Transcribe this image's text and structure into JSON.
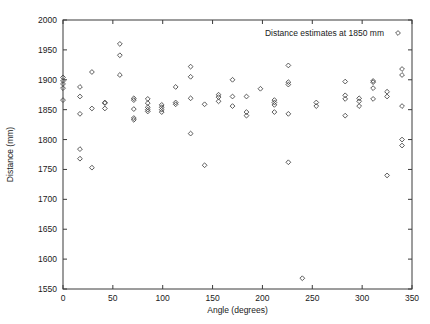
{
  "figure": {
    "background": "#ffffff",
    "frame_color": "#3a3a3a",
    "marker_color": "#4a4a4a",
    "marker_shape": "diamond"
  },
  "chart_data": {
    "type": "scatter",
    "title": "",
    "xlabel": "Angle (degrees)",
    "ylabel": "Distance (mm)",
    "xlim": [
      0,
      350
    ],
    "ylim": [
      1550,
      2000
    ],
    "xticks": [
      0,
      50,
      100,
      150,
      200,
      250,
      300,
      350
    ],
    "yticks": [
      1550,
      1600,
      1650,
      1700,
      1750,
      1800,
      1850,
      1900,
      1950,
      2000
    ],
    "grid": false,
    "legend": {
      "position": "top-right",
      "entries": [
        {
          "label": "Distance estimates at 1850 mm",
          "marker": "diamond"
        }
      ]
    },
    "series": [
      {
        "name": "Distance estimates at 1850 mm",
        "points": [
          [
            0,
            1904
          ],
          [
            0,
            1898
          ],
          [
            0,
            1893
          ],
          [
            0,
            1886
          ],
          [
            0,
            1866
          ],
          [
            17,
            1888
          ],
          [
            17,
            1872
          ],
          [
            17,
            1843
          ],
          [
            17,
            1784
          ],
          [
            17,
            1768
          ],
          [
            29,
            1913
          ],
          [
            29,
            1852
          ],
          [
            29,
            1753
          ],
          [
            42,
            1862
          ],
          [
            42,
            1861
          ],
          [
            42,
            1852
          ],
          [
            57,
            1960
          ],
          [
            57,
            1941
          ],
          [
            57,
            1908
          ],
          [
            71,
            1869
          ],
          [
            71,
            1866
          ],
          [
            71,
            1851
          ],
          [
            71,
            1836
          ],
          [
            71,
            1833
          ],
          [
            85,
            1868
          ],
          [
            85,
            1861
          ],
          [
            85,
            1854
          ],
          [
            85,
            1850
          ],
          [
            85,
            1847
          ],
          [
            99,
            1858
          ],
          [
            99,
            1854
          ],
          [
            99,
            1850
          ],
          [
            99,
            1846
          ],
          [
            113,
            1888
          ],
          [
            113,
            1862
          ],
          [
            113,
            1859
          ],
          [
            128,
            1922
          ],
          [
            128,
            1905
          ],
          [
            128,
            1869
          ],
          [
            128,
            1810
          ],
          [
            142,
            1859
          ],
          [
            142,
            1757
          ],
          [
            156,
            1875
          ],
          [
            156,
            1871
          ],
          [
            156,
            1864
          ],
          [
            170,
            1900
          ],
          [
            170,
            1872
          ],
          [
            170,
            1856
          ],
          [
            184,
            1872
          ],
          [
            184,
            1846
          ],
          [
            184,
            1840
          ],
          [
            198,
            1885
          ],
          [
            212,
            1866
          ],
          [
            212,
            1862
          ],
          [
            212,
            1858
          ],
          [
            212,
            1846
          ],
          [
            226,
            1924
          ],
          [
            226,
            1896
          ],
          [
            226,
            1892
          ],
          [
            226,
            1843
          ],
          [
            226,
            1762
          ],
          [
            240,
            1568
          ],
          [
            254,
            1862
          ],
          [
            254,
            1856
          ],
          [
            283,
            1897
          ],
          [
            283,
            1874
          ],
          [
            283,
            1868
          ],
          [
            283,
            1840
          ],
          [
            297,
            1869
          ],
          [
            297,
            1864
          ],
          [
            297,
            1856
          ],
          [
            311,
            1898
          ],
          [
            311,
            1896
          ],
          [
            311,
            1886
          ],
          [
            311,
            1868
          ],
          [
            325,
            1880
          ],
          [
            325,
            1872
          ],
          [
            325,
            1740
          ],
          [
            340,
            1918
          ],
          [
            340,
            1908
          ],
          [
            340,
            1856
          ],
          [
            340,
            1800
          ],
          [
            340,
            1790
          ]
        ]
      }
    ]
  }
}
